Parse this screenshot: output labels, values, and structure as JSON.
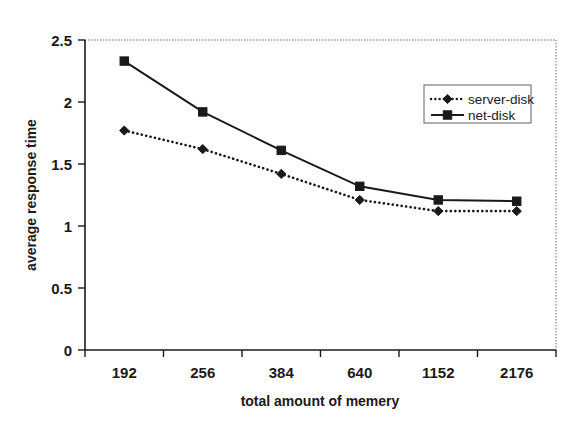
{
  "chart_data": {
    "type": "line",
    "title": "",
    "xlabel": "total amount of memery",
    "ylabel": "average response time",
    "categories": [
      "192",
      "256",
      "384",
      "640",
      "1152",
      "2176"
    ],
    "ylim": [
      0,
      2.5
    ],
    "yticks": [
      "0",
      "0.5",
      "1",
      "1.5",
      "2",
      "2.5"
    ],
    "ytick_values": [
      0,
      0.5,
      1,
      1.5,
      2,
      2.5
    ],
    "grid": false,
    "legend_position": "top-right",
    "series": [
      {
        "name": "server-disk",
        "values": [
          1.77,
          1.62,
          1.42,
          1.21,
          1.12,
          1.12
        ],
        "line_style": "dotted",
        "marker": "diamond",
        "color": "#1a1a1a"
      },
      {
        "name": "net-disk",
        "values": [
          2.33,
          1.92,
          1.61,
          1.32,
          1.21,
          1.2
        ],
        "line_style": "solid",
        "marker": "square",
        "color": "#1a1a1a"
      }
    ]
  },
  "legend": {
    "entries": [
      {
        "label": "server-disk"
      },
      {
        "label": "net-disk"
      }
    ]
  },
  "axes": {
    "y_title": "average response time",
    "x_title": "total amount of memery"
  },
  "colors": {
    "ink": "#1a1a1a",
    "plot_border": "#9a9a9a",
    "background": "#ffffff"
  }
}
